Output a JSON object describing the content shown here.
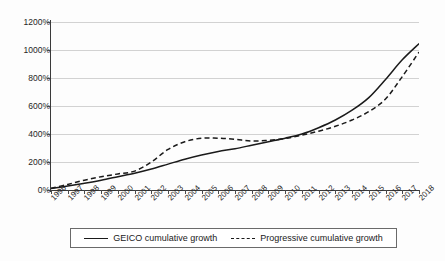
{
  "chart_data": {
    "type": "line",
    "title": "",
    "subtitle": "",
    "xlabel": "",
    "ylabel": "",
    "grid": true,
    "legend_position": "bottom",
    "xlim": [
      1996,
      2018
    ],
    "ylim": [
      0,
      1200
    ],
    "y_tick_suffix": "%",
    "y_ticks": [
      0,
      200,
      400,
      600,
      800,
      1000,
      1200
    ],
    "y_tick_labels": [
      "0%",
      "200%",
      "400%",
      "600%",
      "800%",
      "1000%",
      "1200%"
    ],
    "categories": [
      "1996",
      "1997",
      "1998",
      "1999",
      "2000",
      "2001",
      "2002",
      "2003",
      "2004",
      "2005",
      "2006",
      "2007",
      "2008",
      "2009",
      "2010",
      "2011",
      "2012",
      "2013",
      "2014",
      "2015",
      "2016",
      "2017",
      "2018"
    ],
    "series": [
      {
        "name": "GEICO cumulative growth",
        "style": "solid",
        "color": "#1a1a1a",
        "values": [
          10,
          28,
          48,
          70,
          95,
          120,
          150,
          185,
          220,
          250,
          275,
          295,
          320,
          345,
          370,
          400,
          445,
          500,
          570,
          660,
          790,
          930,
          1045
        ]
      },
      {
        "name": "Progressive cumulative growth",
        "style": "dashed",
        "color": "#1a1a1a",
        "values": [
          12,
          40,
          70,
          95,
          115,
          135,
          200,
          290,
          345,
          370,
          370,
          362,
          350,
          355,
          368,
          392,
          420,
          455,
          500,
          560,
          650,
          810,
          985
        ]
      }
    ]
  },
  "legend": {
    "entries": [
      {
        "label": "GEICO cumulative growth",
        "style": "solid"
      },
      {
        "label": "Progressive cumulative growth",
        "style": "dashed"
      }
    ]
  }
}
